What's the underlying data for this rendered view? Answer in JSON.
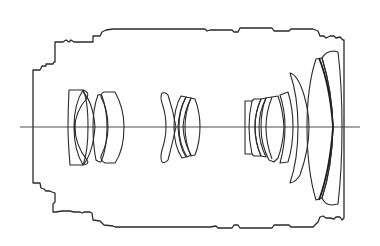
{
  "diagram": {
    "type": "lens-optical-cross-section",
    "title": "Zoom lens optical construction",
    "colors": {
      "background": "#ffffff",
      "line": "#2a2a2a"
    },
    "optical_axis": {
      "y": 127,
      "x_start": 20,
      "x_end": 360
    },
    "lens_groups": [
      {
        "id": "group-1",
        "label": "Front group",
        "x_range": [
          68,
          124
        ],
        "elements": 4
      },
      {
        "id": "group-2",
        "label": "Variator group",
        "x_range": [
          160,
          196
        ],
        "elements": 4
      },
      {
        "id": "group-3",
        "label": "Rear group",
        "x_range": [
          241,
          290
        ],
        "elements": 5
      },
      {
        "id": "group-4",
        "label": "Front large meniscus elements",
        "x_range": [
          290,
          340
        ],
        "elements": 3
      }
    ],
    "housing": {
      "label": "Lens barrel outline"
    }
  }
}
